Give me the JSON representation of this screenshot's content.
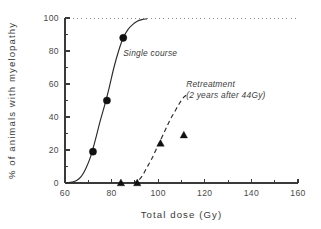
{
  "chart_data": {
    "type": "scatter",
    "title": "",
    "xlabel": "Total dose (Gy)",
    "ylabel": "% of animals with myelopathy",
    "xlim": [
      60,
      160
    ],
    "ylim": [
      0,
      100
    ],
    "xticks": [
      60,
      80,
      100,
      120,
      140,
      160
    ],
    "xtick_labels": [
      "60",
      "80",
      "100",
      "120",
      "140",
      "160"
    ],
    "xminor_ticks": [
      70,
      90,
      110,
      130,
      150
    ],
    "yticks": [
      0,
      20,
      40,
      60,
      80,
      100
    ],
    "ytick_labels": [
      "0",
      "20",
      "40",
      "60",
      "80",
      "100"
    ],
    "yminor_ticks": [
      10,
      30,
      50,
      70,
      90
    ],
    "grid": false,
    "legend_position": "inline-annotations",
    "annotations": [
      {
        "id": "single-course",
        "lines": [
          "Single course"
        ],
        "x": 85,
        "y": 77,
        "style": "italic"
      },
      {
        "id": "retreatment",
        "lines": [
          "Retreatment",
          "(2 years after 44Gy)"
        ],
        "x": 112,
        "y": 58,
        "style": "italic"
      }
    ],
    "reference_lines": [
      {
        "id": "ceiling-100",
        "orientation": "horizontal",
        "value": 100,
        "style": "dotted"
      }
    ],
    "series": [
      {
        "name": "Single course",
        "marker": "circle",
        "line_style": "solid",
        "points": [
          {
            "x": 72,
            "y": 19
          },
          {
            "x": 78,
            "y": 50
          },
          {
            "x": 85,
            "y": 88
          }
        ],
        "fit_curve": [
          {
            "x": 60.5,
            "y": 0
          },
          {
            "x": 63,
            "y": 0.5
          },
          {
            "x": 65,
            "y": 1.5
          },
          {
            "x": 67,
            "y": 4
          },
          {
            "x": 69,
            "y": 9
          },
          {
            "x": 71,
            "y": 16
          },
          {
            "x": 73,
            "y": 26
          },
          {
            "x": 75,
            "y": 37
          },
          {
            "x": 77,
            "y": 47
          },
          {
            "x": 79,
            "y": 58
          },
          {
            "x": 81,
            "y": 70
          },
          {
            "x": 83,
            "y": 80
          },
          {
            "x": 85,
            "y": 88
          },
          {
            "x": 87,
            "y": 93
          },
          {
            "x": 89,
            "y": 96
          },
          {
            "x": 91,
            "y": 98
          },
          {
            "x": 93,
            "y": 99
          },
          {
            "x": 95,
            "y": 99.5
          }
        ]
      },
      {
        "name": "Retreatment (2 years after 44Gy)",
        "marker": "triangle",
        "line_style": "dashed",
        "points": [
          {
            "x": 84,
            "y": 0
          },
          {
            "x": 91,
            "y": 0
          },
          {
            "x": 101,
            "y": 24
          },
          {
            "x": 111,
            "y": 29
          }
        ],
        "fit_curve": [
          {
            "x": 89,
            "y": 0
          },
          {
            "x": 91,
            "y": 1
          },
          {
            "x": 93,
            "y": 4
          },
          {
            "x": 95,
            "y": 9
          },
          {
            "x": 97,
            "y": 14
          },
          {
            "x": 99,
            "y": 20
          },
          {
            "x": 101,
            "y": 26
          },
          {
            "x": 103,
            "y": 32
          },
          {
            "x": 105,
            "y": 38
          },
          {
            "x": 107,
            "y": 43
          },
          {
            "x": 109,
            "y": 48
          },
          {
            "x": 111,
            "y": 52
          },
          {
            "x": 113,
            "y": 54
          }
        ]
      }
    ]
  },
  "colors": {
    "axis": "#3a3a3a",
    "marker": "#111111",
    "curve": "#2a2a2a",
    "ceiling": "#8a8a8a",
    "background": "#ffffff"
  }
}
